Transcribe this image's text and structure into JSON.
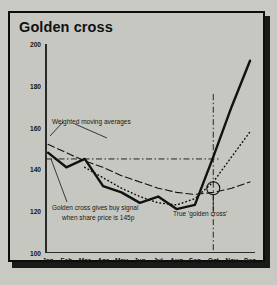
{
  "title": "Golden cross",
  "annotations": {
    "weighted": "Weighted moving averages",
    "golden_line1": "Golden cross gives buy signal",
    "golden_line2": "when share price is 145p",
    "true_cross": "True 'golden cross'"
  },
  "colors": {
    "background": "#c7c7c1",
    "frame": "#0d0d0c",
    "line": "#111111",
    "text": "#15150f"
  },
  "chart_data": {
    "type": "line",
    "title": "Golden cross",
    "xlabel": "",
    "ylabel": "",
    "ylim": [
      100,
      200
    ],
    "yticks": [
      100,
      120,
      140,
      160,
      180,
      200
    ],
    "grid": false,
    "legend": "none",
    "x": [
      "Jan",
      "Feb",
      "Mar",
      "Apr",
      "May",
      "Jun",
      "Jul",
      "Aug",
      "Sep",
      "Oct",
      "Nov",
      "Dec"
    ],
    "series": [
      {
        "name": "Share price",
        "style": "solid-thick",
        "values": [
          148,
          141,
          145,
          132,
          129,
          124,
          127,
          121,
          123,
          146,
          170,
          192
        ]
      },
      {
        "name": "Long weighted moving average",
        "style": "dashed",
        "values": [
          152,
          148,
          144,
          141,
          137,
          134,
          131,
          129,
          128,
          129,
          131,
          134
        ]
      },
      {
        "name": "Short weighted moving average",
        "style": "dotted",
        "values": [
          null,
          null,
          141,
          136,
          131,
          127,
          124,
          123,
          126,
          134,
          146,
          158
        ]
      }
    ],
    "reference_lines": [
      {
        "name": "buy-signal-price",
        "type": "horizontal",
        "style": "dash-dot",
        "value": 145,
        "label": "145p"
      },
      {
        "name": "golden-cross-date",
        "type": "vertical",
        "style": "dash-dot",
        "value": "Oct"
      }
    ],
    "markers": [
      {
        "name": "true-golden-cross",
        "x": "Oct",
        "y": 131,
        "symbol": "crosshair-circle",
        "label": "True 'golden cross'"
      }
    ]
  }
}
